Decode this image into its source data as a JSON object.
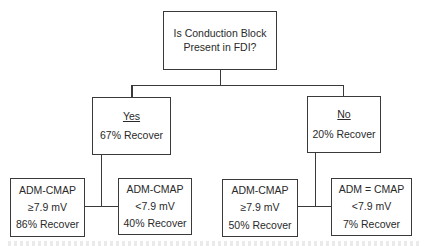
{
  "diagram": {
    "type": "decision-tree",
    "line_color": "#3a3a3a",
    "root": {
      "lines": [
        "Is Conduction Block",
        "Present in FDI?"
      ]
    },
    "branches": [
      {
        "label": "Yes",
        "summary": "67% Recover",
        "children": [
          {
            "lines": [
              "ADM-CMAP",
              "≥7.9 mV",
              "86% Recover"
            ]
          },
          {
            "lines": [
              "ADM-CMAP",
              "<7.9 mV",
              "40% Recover"
            ]
          }
        ]
      },
      {
        "label": "No",
        "summary": "20% Recover",
        "children": [
          {
            "lines": [
              "ADM-CMAP",
              "≥7.9 mV",
              "50% Recover"
            ]
          },
          {
            "lines": [
              "ADM = CMAP",
              "<7.9 mV",
              "7% Recover"
            ]
          }
        ]
      }
    ]
  }
}
